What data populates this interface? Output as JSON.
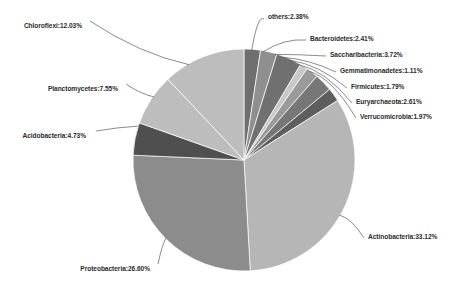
{
  "chart_data": {
    "type": "pie",
    "title": "",
    "subtitle": "",
    "xlabel": "",
    "ylabel": "",
    "legend_position": "none",
    "grid": false,
    "label_format": "{name}:{value}%",
    "start_angle_deg": 0,
    "direction": "clockwise",
    "units": "percent",
    "total": 100.02,
    "categories": [
      "others",
      "Bacteroidetes",
      "Saccharibacteria",
      "Gemmatimonadetes",
      "Firmicutes",
      "Euryarchaeota",
      "Verrucomicrobia",
      "Actinobacteria",
      "Proteobacteria",
      "Acidobacteria",
      "Planctomycetes",
      "Chloroflexi"
    ],
    "values": [
      2.38,
      2.41,
      3.72,
      1.11,
      1.79,
      2.61,
      1.97,
      33.12,
      26.6,
      4.73,
      7.55,
      12.03
    ],
    "colors": [
      "#6e6e6e",
      "#8f8f8f",
      "#707070",
      "#c8c8c8",
      "#9a9a9a",
      "#777777",
      "#5e5e5e",
      "#b6b6b6",
      "#8c8c8c",
      "#4f4f4f",
      "#bdbdbd",
      "#bdbdbd"
    ],
    "slices": [
      {
        "name": "others",
        "value": 2.38,
        "label": "others:2.38%",
        "color": "#6e6e6e"
      },
      {
        "name": "Bacteroidetes",
        "value": 2.41,
        "label": "Bacteroidetes:2.41%",
        "color": "#8f8f8f"
      },
      {
        "name": "Saccharibacteria",
        "value": 3.72,
        "label": "Saccharibacteria:3.72%",
        "color": "#707070"
      },
      {
        "name": "Gemmatimonadetes",
        "value": 1.11,
        "label": "Gemmatimonadetes:1.11%",
        "color": "#c8c8c8"
      },
      {
        "name": "Firmicutes",
        "value": 1.79,
        "label": "Firmicutes:1.79%",
        "color": "#9a9a9a"
      },
      {
        "name": "Euryarchaeota",
        "value": 2.61,
        "label": "Euryarchaeota:2.61%",
        "color": "#777777"
      },
      {
        "name": "Verrucomicrobia",
        "value": 1.97,
        "label": "Verrucomicrobia:1.97%",
        "color": "#5e5e5e"
      },
      {
        "name": "Actinobacteria",
        "value": 33.12,
        "label": "Actinobacteria:33.12%",
        "color": "#b6b6b6"
      },
      {
        "name": "Proteobacteria",
        "value": 26.6,
        "label": "Proteobacteria:26.60%",
        "color": "#8c8c8c"
      },
      {
        "name": "Acidobacteria",
        "value": 4.73,
        "label": "Acidobacteria:4.73%",
        "color": "#4f4f4f"
      },
      {
        "name": "Planctomycetes",
        "value": 7.55,
        "label": "Planctomycetes:7.55%",
        "color": "#bdbdbd"
      },
      {
        "name": "Chloroflexi",
        "value": 12.03,
        "label": "Chloroflexi:12.03%",
        "color": "#bdbdbd"
      }
    ]
  },
  "geometry": {
    "center_x": 244,
    "center_y": 160,
    "radius": 111
  }
}
